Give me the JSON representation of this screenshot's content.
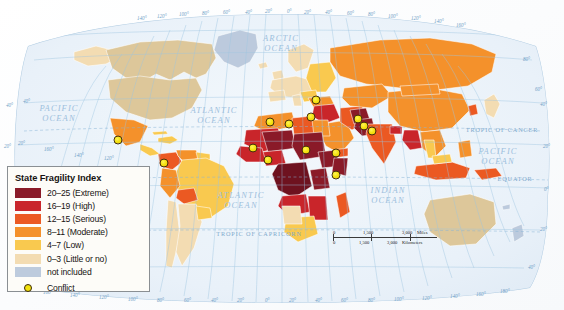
{
  "map": {
    "title": "State Fragility Index World Map",
    "projection": "Robinson",
    "background_color": "#fdfdfd",
    "ocean_color": "#eef4fa",
    "graticule_color": "#9dc4e0"
  },
  "legend": {
    "title": "State Fragility Index",
    "items": [
      {
        "label": "20–25 (Extreme)",
        "color": "#8a1b28"
      },
      {
        "label": "16–19 (High)",
        "color": "#c9262b"
      },
      {
        "label": "12–15 (Serious)",
        "color": "#ec5a23"
      },
      {
        "label": "8–11 (Moderate)",
        "color": "#f4912c"
      },
      {
        "label": "4–7 (Low)",
        "color": "#f9c94f"
      },
      {
        "label": "0–3 (Little or no)",
        "color": "#f3dcb2"
      },
      {
        "label": "not included",
        "color": "#bdcbdd"
      }
    ],
    "conflict": {
      "label": "Conflict",
      "fill": "#f2e20c",
      "stroke": "#3b2a09"
    }
  },
  "ocean_labels": [
    {
      "id": "pacific-west",
      "text": "PACIFIC\nOCEAN",
      "x": 57,
      "y": 112
    },
    {
      "id": "atlantic-north",
      "text": "ATLANTIC\nOCEAN",
      "x": 213,
      "y": 114
    },
    {
      "id": "arctic",
      "text": "ARCTIC\nOCEAN",
      "x": 280,
      "y": 42
    },
    {
      "id": "atlantic-south",
      "text": "ATLANTIC\nOCEAN",
      "x": 240,
      "y": 199
    },
    {
      "id": "indian",
      "text": "INDIAN\nOCEAN",
      "x": 388,
      "y": 194
    },
    {
      "id": "pacific-east",
      "text": "PACIFIC\nOCEAN",
      "x": 498,
      "y": 155
    }
  ],
  "reference_lines": [
    {
      "id": "tropic-of-cancer",
      "text": "TROPIC OF CANCER",
      "x": 502,
      "y": 131
    },
    {
      "id": "equator",
      "text": "EQUATOR",
      "x": 515,
      "y": 180
    },
    {
      "id": "tropic-of-capricorn",
      "text": "TROPIC OF CAPRICORN",
      "x": 259,
      "y": 235
    }
  ],
  "graticule": {
    "top_longitudes": [
      "140°",
      "120°",
      "100°",
      "80°",
      "60°",
      "40°",
      "20°",
      "0°",
      "20°",
      "40°",
      "60°",
      "80°",
      "100°",
      "120°",
      "140°",
      "160°"
    ],
    "bottom_longitudes": [
      "160°",
      "140°",
      "120°",
      "100°",
      "80°",
      "60°",
      "40°",
      "20°",
      "0°",
      "20°",
      "40°",
      "60°",
      "80°",
      "100°",
      "120°",
      "140°",
      "160°",
      "180°"
    ],
    "left_latitudes": [
      "40°",
      "20°",
      "0°",
      "20°",
      "40°"
    ],
    "right_latitudes": [
      "80°",
      "60°",
      "40°",
      "20°",
      "0°",
      "20°",
      "40°"
    ]
  },
  "scalebar": {
    "miles": {
      "ticks": [
        "0",
        "1,500",
        "3,000"
      ],
      "unit": "Miles"
    },
    "kilometers": {
      "ticks": [
        "0",
        "1,500",
        "3,000"
      ],
      "unit": "Kilometers"
    }
  },
  "conflicts": [
    {
      "id": "conflict-mexico",
      "x": 118,
      "y": 140
    },
    {
      "id": "conflict-colombia",
      "x": 164,
      "y": 163
    },
    {
      "id": "conflict-mali",
      "x": 253,
      "y": 148
    },
    {
      "id": "conflict-nigeria",
      "x": 268,
      "y": 160
    },
    {
      "id": "conflict-algeria",
      "x": 270,
      "y": 122
    },
    {
      "id": "conflict-libya-chad",
      "x": 289,
      "y": 124
    },
    {
      "id": "conflict-turkey",
      "x": 316,
      "y": 100
    },
    {
      "id": "conflict-sudan",
      "x": 306,
      "y": 150
    },
    {
      "id": "conflict-syria",
      "x": 311,
      "y": 117
    },
    {
      "id": "conflict-yemen",
      "x": 336,
      "y": 153
    },
    {
      "id": "conflict-somalia",
      "x": 336,
      "y": 175
    },
    {
      "id": "conflict-afghanistan",
      "x": 358,
      "y": 119
    },
    {
      "id": "conflict-pakistan",
      "x": 364,
      "y": 126
    },
    {
      "id": "conflict-india",
      "x": 372,
      "y": 131
    }
  ]
}
